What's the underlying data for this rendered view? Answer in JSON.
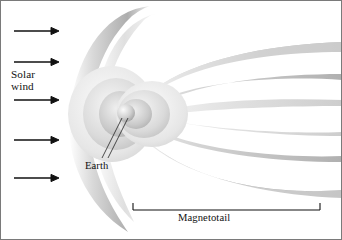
{
  "figure": {
    "background_color": "#ffffff",
    "frame_color": "#7a7a7a",
    "ink_color": "#111111"
  },
  "labels": {
    "solar_wind": "Solar\nwind",
    "earth": "Earth",
    "magnetotail": "Magnetotail"
  },
  "icons": {
    "solar_wind_arrow": "arrow-right-icon",
    "earth_leader_line": "leader-line-icon",
    "magnetotail_bracket": "span-bracket-icon",
    "earth_body": "earth-icon"
  },
  "diagram": {
    "type": "schematic",
    "solar_wind_arrows": [
      {
        "y": 31,
        "x1": 14,
        "x2": 57
      },
      {
        "y": 62,
        "x1": 14,
        "x2": 57
      },
      {
        "y": 100,
        "x1": 14,
        "x2": 57
      },
      {
        "y": 140,
        "x1": 14,
        "x2": 57
      },
      {
        "y": 178,
        "x1": 14,
        "x2": 57
      }
    ],
    "earth_position": {
      "x": 126,
      "y": 113
    },
    "bow_shock": {
      "nose_x": 63,
      "center_y": 116
    },
    "magnetotail_bracket": {
      "x1": 133,
      "x2": 320,
      "y": 210,
      "tick_height": 7
    },
    "palette": {
      "lobe_dark": "#8e8e8e",
      "lobe_mid": "#b5b5b5",
      "lobe_light": "#d8d8d8",
      "lobe_pale": "#ededed",
      "earth_fill": "#cfcfcf"
    }
  }
}
